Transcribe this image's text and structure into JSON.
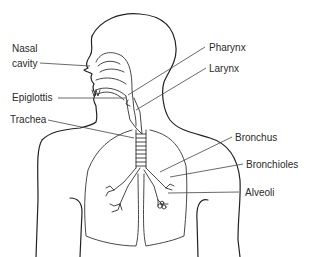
{
  "diagram": {
    "labels": {
      "nasal_cavity_line1": "Nasal",
      "nasal_cavity_line2": "cavity",
      "epiglottis": "Epiglottis",
      "trachea": "Trachea",
      "pharynx": "Pharynx",
      "larynx": "Larynx",
      "bronchus": "Bronchus",
      "bronchioles": "Bronchioles",
      "alveoli": "Alveoli"
    },
    "colors": {
      "line": "#222222",
      "text": "#2a2a2a",
      "background": "#ffffff"
    }
  }
}
